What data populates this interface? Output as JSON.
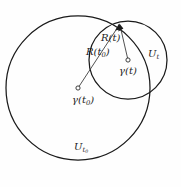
{
  "figure": {
    "kind": "geometric-diagram",
    "background_color": "#fefefe",
    "stroke_color": "#1a1a1a",
    "label_color": "#1c1c1c",
    "width": 181,
    "height": 187
  },
  "shapes": {
    "large_circle": {
      "name": "U_t0",
      "cx": 78,
      "cy": 88,
      "r": 72
    },
    "small_circle": {
      "name": "U_t",
      "cx": 128,
      "cy": 60,
      "r": 39
    },
    "boundary_point": {
      "x": 119,
      "y": 24
    }
  },
  "points": [
    {
      "id": "gamma-t0",
      "x": 78,
      "y": 88,
      "marker": "open-circle"
    },
    {
      "id": "gamma-t",
      "x": 128,
      "y": 60,
      "marker": "open-circle"
    }
  ],
  "segments": [
    {
      "id": "radius-t0",
      "from": "gamma-t0",
      "to": "boundary_point",
      "arrow": true
    },
    {
      "id": "radius-t",
      "from": "gamma-t",
      "to": "boundary_point",
      "arrow": true
    }
  ],
  "labels": {
    "radius_t": {
      "base": "R(t)",
      "text": "R(t)"
    },
    "radius_t0": {
      "base": "R(t",
      "sub": "0",
      "close": ")",
      "text": "R(t0)"
    },
    "gamma_t": {
      "base": "γ(t)",
      "text": "γ(t)"
    },
    "gamma_t0": {
      "base": "γ(t",
      "sub": "0",
      "close": ")",
      "text": "γ(t0)"
    },
    "set_t": {
      "base": "U",
      "sub": "t",
      "text": "Ut"
    },
    "set_t0": {
      "base": "U",
      "sub": "t",
      "sub2": "0",
      "text": "Ut0"
    }
  }
}
